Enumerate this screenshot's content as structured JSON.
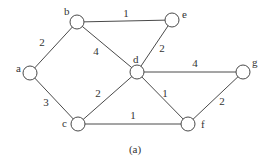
{
  "caption": "(a)",
  "nodes": [
    {
      "id": "a",
      "label": "a",
      "x": 30,
      "y": 73,
      "lx": 16,
      "ly": 72
    },
    {
      "id": "b",
      "label": "b",
      "x": 77,
      "y": 22,
      "lx": 64,
      "ly": 15
    },
    {
      "id": "c",
      "label": "c",
      "x": 78,
      "y": 124,
      "lx": 62,
      "ly": 127
    },
    {
      "id": "d",
      "label": "d",
      "x": 137,
      "y": 72,
      "lx": 133,
      "ly": 63
    },
    {
      "id": "e",
      "label": "e",
      "x": 172,
      "y": 20,
      "lx": 182,
      "ly": 18
    },
    {
      "id": "f",
      "label": "f",
      "x": 188,
      "y": 124,
      "lx": 201,
      "ly": 128
    },
    {
      "id": "g",
      "label": "g",
      "x": 243,
      "y": 72,
      "lx": 252,
      "ly": 66
    }
  ],
  "edges": [
    {
      "from": "a",
      "to": "b",
      "weight": "2",
      "lx": 42,
      "ly": 46
    },
    {
      "from": "a",
      "to": "c",
      "weight": "3",
      "lx": 46,
      "ly": 106
    },
    {
      "from": "b",
      "to": "e",
      "weight": "1",
      "lx": 126,
      "ly": 17
    },
    {
      "from": "b",
      "to": "d",
      "weight": "4",
      "lx": 96,
      "ly": 55
    },
    {
      "from": "e",
      "to": "d",
      "weight": "2",
      "lx": 162,
      "ly": 52
    },
    {
      "from": "d",
      "to": "g",
      "weight": "4",
      "lx": 195,
      "ly": 67
    },
    {
      "from": "d",
      "to": "c",
      "weight": "2",
      "lx": 98,
      "ly": 97
    },
    {
      "from": "d",
      "to": "f",
      "weight": "1",
      "lx": 165,
      "ly": 97
    },
    {
      "from": "c",
      "to": "f",
      "weight": "1",
      "lx": 133,
      "ly": 119
    },
    {
      "from": "f",
      "to": "g",
      "weight": "2",
      "lx": 222,
      "ly": 105
    }
  ]
}
